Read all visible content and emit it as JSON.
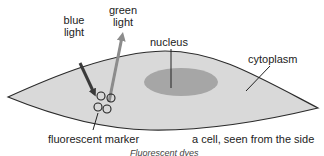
{
  "diagram": {
    "labels": {
      "blue_light": [
        "blue",
        "light"
      ],
      "green_light": [
        "green",
        "light"
      ],
      "nucleus": "nucleus",
      "cytoplasm": "cytoplasm",
      "fluorescent_marker": "fluorescent marker",
      "cell_side": "a cell, seen from the side"
    },
    "caption": "Fluorescent dyes",
    "colors": {
      "cell_fill": "#d9d9d9",
      "cell_outline": "#2b2b2b",
      "nucleus_fill": "#a6a6a6",
      "blue_light_arrow": "#3a3a3a",
      "green_light_arrow": "#8c8c8c",
      "marker_outline": "#222222",
      "text": "#222222"
    },
    "markers": [
      {
        "cx": 101,
        "cy": 96,
        "r": 4
      },
      {
        "cx": 111,
        "cy": 98,
        "r": 4
      },
      {
        "cx": 98,
        "cy": 107,
        "r": 4
      },
      {
        "cx": 107,
        "cy": 109,
        "r": 4
      }
    ]
  }
}
